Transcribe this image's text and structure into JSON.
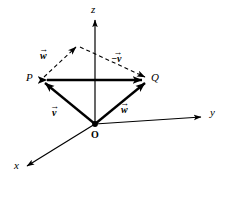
{
  "figure": {
    "type": "vector-diagram-3d",
    "background_color": "#ffffff",
    "stroke_color": "#000000",
    "width": 230,
    "height": 199
  },
  "axes": {
    "x": {
      "label": "x",
      "label_x": 14,
      "label_y": 160,
      "direction": "down-left",
      "arrow": true
    },
    "y": {
      "label": "y",
      "label_x": 210,
      "label_y": 113,
      "direction": "right",
      "arrow": true
    },
    "z": {
      "label": "z",
      "label_x": 91,
      "label_y": 4,
      "direction": "up",
      "arrow": true
    }
  },
  "points": {
    "origin": {
      "label": "O",
      "label_x": 91,
      "label_y": 131,
      "x": 95,
      "y": 124,
      "bold": true,
      "dot": true
    },
    "P": {
      "label": "P",
      "label_x": 26,
      "label_y": 73,
      "x": 42,
      "y": 80
    },
    "Q": {
      "label": "Q",
      "label_x": 151,
      "label_y": 73,
      "x": 146,
      "y": 80
    },
    "apex": {
      "x": 78,
      "y": 45
    }
  },
  "vectors": [
    {
      "name": "v-from-origin-to-P",
      "letter": "v",
      "accent": "→",
      "sign": "",
      "label_x": 52,
      "label_y": 107,
      "from": "origin",
      "to": "P",
      "style": "solid"
    },
    {
      "name": "w-from-origin-to-Q",
      "letter": "w",
      "accent": "→",
      "sign": "",
      "label_x": 121,
      "label_y": 104,
      "from": "origin",
      "to": "Q",
      "style": "solid"
    },
    {
      "name": "w-from-P-to-apex",
      "letter": "w",
      "accent": "→",
      "sign": "",
      "label_x": 40,
      "label_y": 50,
      "from": "P",
      "to": "apex",
      "style": "dashed"
    },
    {
      "name": "negative-v-from-apex-to-Q",
      "letter": "v",
      "accent": "→",
      "sign": "−",
      "label_x": 113,
      "label_y": 53,
      "from": "apex",
      "to": "Q",
      "style": "dashed"
    },
    {
      "name": "PQ-double-arrow",
      "letter": "",
      "accent": "",
      "sign": "",
      "label_x": 0,
      "label_y": 0,
      "from": "P",
      "to": "Q",
      "style": "solid-double-headed"
    }
  ]
}
